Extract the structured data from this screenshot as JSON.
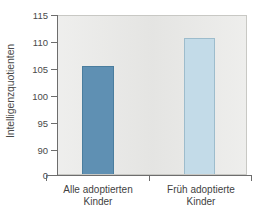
{
  "chart_data": {
    "type": "bar",
    "title": "",
    "subtitle": "",
    "xlabel": "",
    "ylabel": "Intelligenzquotienten",
    "categories": [
      "Alle adoptierten\nKinder",
      "Früh adoptierte\nKinder"
    ],
    "values": [
      105.8,
      111.0
    ],
    "series": [
      {
        "name": "Intelligenzquotienten",
        "values": [
          105.8,
          111.0
        ]
      }
    ],
    "ylim": [
      88.5,
      115
    ],
    "yticks": [
      0,
      90,
      95,
      100,
      105,
      110,
      115
    ],
    "ytick_labels": [
      "0",
      "90",
      "95",
      "100",
      "105",
      "110",
      "115"
    ],
    "axis_break": true,
    "axis_break_between": [
      0,
      90
    ],
    "grid": false,
    "legend": "none",
    "bar_colors": [
      "#5f90b3",
      "#c3dbe8"
    ],
    "bar_edge_colors": [
      "#4a7d9e",
      "#9dbccc"
    ],
    "plot_background": "#e9e9e7",
    "figure_background": "#ffffff",
    "axis_color": "#6d6d6d",
    "text_color": "#3f3f3f"
  },
  "axes": {
    "y_title": "Intelligenzquotienten",
    "ticks": [
      {
        "label": "115",
        "value": 115
      },
      {
        "label": "110",
        "value": 110
      },
      {
        "label": "105",
        "value": 105
      },
      {
        "label": "100",
        "value": 100
      },
      {
        "label": "95",
        "value": 95
      },
      {
        "label": "90",
        "value": 90
      },
      {
        "label": "0",
        "value": 0
      }
    ]
  },
  "bars": [
    {
      "label": "Alle adoptierten\nKinder",
      "value": 105.8,
      "color": "#5f90b3"
    },
    {
      "label": "Früh adoptierte\nKinder",
      "value": 111.0,
      "color": "#c3dbe8"
    }
  ]
}
